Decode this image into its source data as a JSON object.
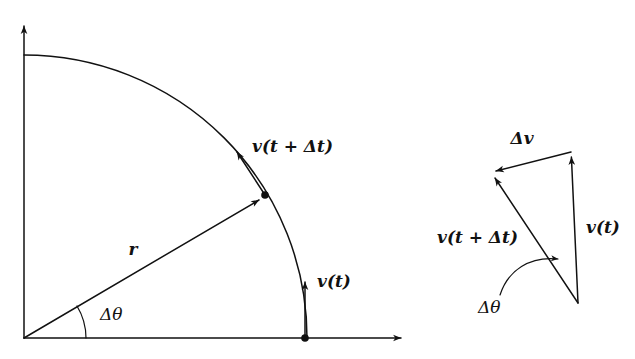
{
  "figure": {
    "background_color": "#ffffff",
    "ink_color": "#111111",
    "width": 635,
    "height": 359
  },
  "left_diagram": {
    "name": "circular-path-diagram",
    "origin": {
      "x": 24,
      "y": 338
    },
    "radius": 283,
    "axes": {
      "y_axis_label": "",
      "x_axis_label": "",
      "y_axis_tip": {
        "x": 24,
        "y": 22
      },
      "x_axis_tip": {
        "x": 405,
        "y": 338
      }
    },
    "labels": {
      "radius": "r",
      "delta_theta": "Δθ",
      "velocity_t": "v(t)",
      "velocity_t_plus_dt": "v(t + Δt)"
    },
    "points": [
      {
        "name": "position-at-t",
        "x": 305,
        "y": 338,
        "angle_deg": 0
      },
      {
        "name": "position-at-t-plus-dt",
        "x": 265,
        "y": 195,
        "angle_deg": 30.7
      }
    ],
    "delta_theta_deg": 30.7
  },
  "right_diagram": {
    "name": "velocity-triangle-diagram",
    "labels": {
      "delta_v": "Δv",
      "velocity_t": "v(t)",
      "velocity_t_plus_dt": "v(t + Δt)",
      "delta_theta": "Δθ"
    },
    "vertices": {
      "tail": {
        "x": 578,
        "y": 303
      },
      "tip_v_t": {
        "x": 571,
        "y": 152
      },
      "tip_v_t_plus_dt": {
        "x": 492,
        "y": 173
      }
    },
    "delta_theta_deg": 30.7
  }
}
